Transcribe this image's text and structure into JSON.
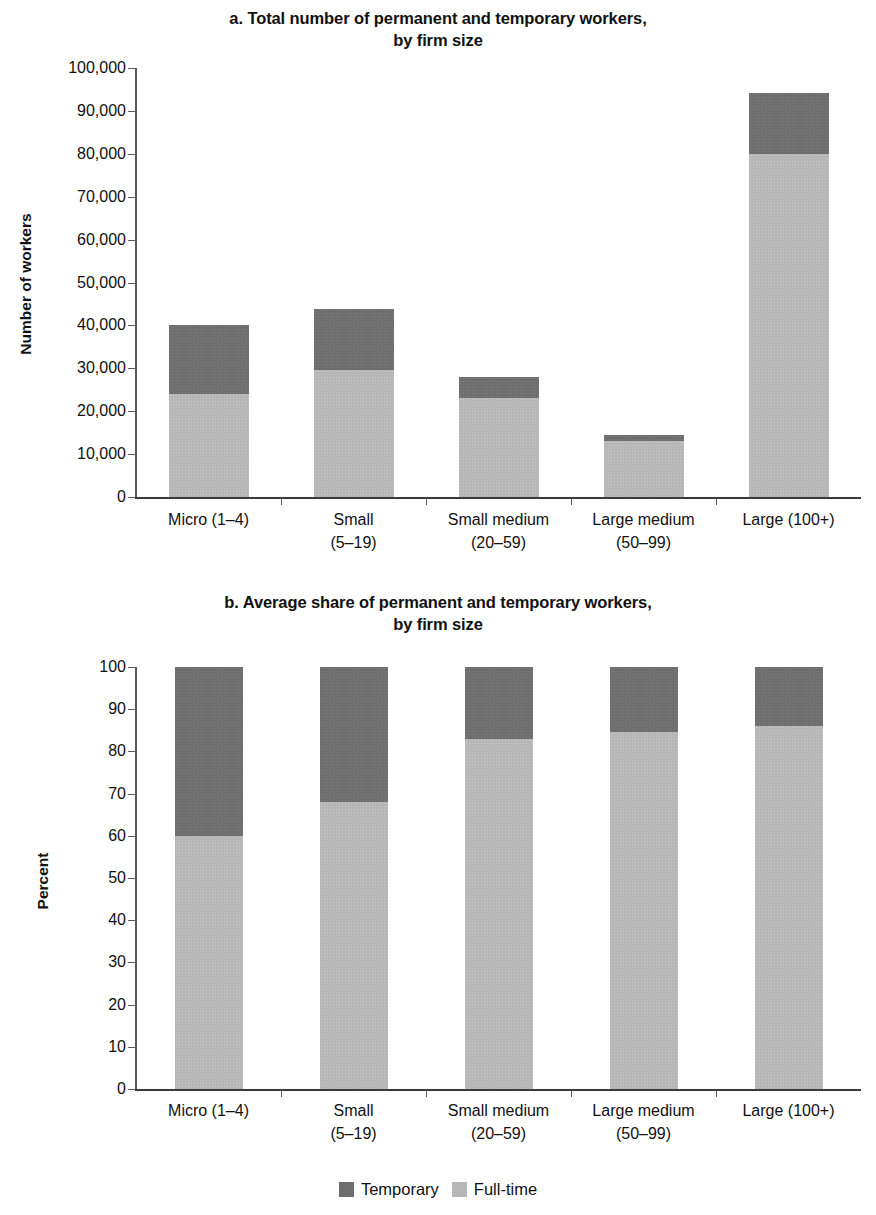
{
  "figure": {
    "legend": [
      {
        "label": "Temporary",
        "color": "#6e6e6e",
        "key": "temporary"
      },
      {
        "label": "Full-time",
        "color": "#b7b7b7",
        "key": "full_time"
      }
    ]
  },
  "panel_a": {
    "title_line1": "a. Total number of permanent and temporary workers,",
    "title_line2": "by firm size"
  },
  "panel_b": {
    "title_line1": "b. Average share of permanent and temporary workers,",
    "title_line2": "by firm size"
  },
  "chart_data": [
    {
      "id": "panel_a",
      "type": "bar",
      "stacked": true,
      "title": "a. Total number of permanent and temporary workers, by firm size",
      "xlabel": "",
      "ylabel": "Number of workers",
      "ylim": [
        0,
        100000
      ],
      "yticks": [
        0,
        10000,
        20000,
        30000,
        40000,
        50000,
        60000,
        70000,
        80000,
        90000,
        100000
      ],
      "ytick_labels": [
        "0",
        "10,000",
        "20,000",
        "30,000",
        "40,000",
        "50,000",
        "60,000",
        "70,000",
        "80,000",
        "90,000",
        "100,000"
      ],
      "grid": false,
      "legend_position": "bottom-center-shared",
      "categories": [
        "Micro (1–4)",
        "Small (5–19)",
        "Small medium (20–59)",
        "Large medium (50–99)",
        "Large (100+)"
      ],
      "category_lines": [
        [
          "Micro (1–4)"
        ],
        [
          "Small",
          "(5–19)"
        ],
        [
          "Small medium",
          "(20–59)"
        ],
        [
          "Large medium",
          "(50–99)"
        ],
        [
          "Large (100+)"
        ]
      ],
      "series": [
        {
          "name": "Full-time",
          "color": "#b7b7b7",
          "values": [
            24000,
            29500,
            23000,
            13000,
            80000
          ]
        },
        {
          "name": "Temporary",
          "color": "#6e6e6e",
          "values": [
            16000,
            14300,
            5000,
            1400,
            14200
          ]
        }
      ],
      "totals": [
        40000,
        43800,
        28000,
        14400,
        94200
      ]
    },
    {
      "id": "panel_b",
      "type": "bar",
      "stacked": true,
      "title": "b. Average share of permanent and temporary workers, by firm size",
      "xlabel": "",
      "ylabel": "Percent",
      "ylim": [
        0,
        100
      ],
      "yticks": [
        0,
        10,
        20,
        30,
        40,
        50,
        60,
        70,
        80,
        90,
        100
      ],
      "ytick_labels": [
        "0",
        "10",
        "20",
        "30",
        "40",
        "50",
        "60",
        "70",
        "80",
        "90",
        "100"
      ],
      "grid": false,
      "legend_position": "bottom-center-shared",
      "categories": [
        "Micro (1–4)",
        "Small (5–19)",
        "Small medium (20–59)",
        "Large medium (50–99)",
        "Large (100+)"
      ],
      "category_lines": [
        [
          "Micro (1–4)"
        ],
        [
          "Small",
          "(5–19)"
        ],
        [
          "Small medium",
          "(20–59)"
        ],
        [
          "Large medium",
          "(50–99)"
        ],
        [
          "Large (100+)"
        ]
      ],
      "series": [
        {
          "name": "Full-time",
          "color": "#b7b7b7",
          "values": [
            60,
            68,
            83,
            84.5,
            86
          ]
        },
        {
          "name": "Temporary",
          "color": "#6e6e6e",
          "values": [
            40,
            32,
            17,
            15.5,
            14
          ]
        }
      ],
      "totals": [
        100,
        100,
        100,
        100,
        100
      ]
    }
  ]
}
